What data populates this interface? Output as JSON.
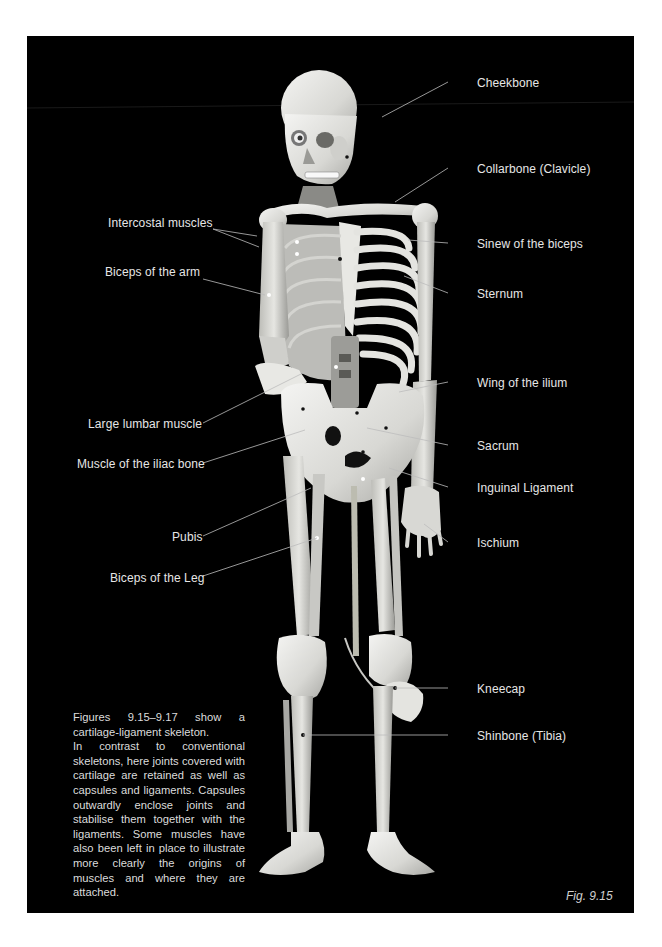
{
  "figure": {
    "number": "Fig. 9.15",
    "background": "#000000",
    "label_color": "#e6e6e6"
  },
  "labels": {
    "left": [
      {
        "id": "intercostal",
        "text": "Intercostal muscles",
        "x": 108,
        "y": 216
      },
      {
        "id": "biceps-arm",
        "text": "Biceps of the arm",
        "x": 105,
        "y": 265
      },
      {
        "id": "lumbar",
        "text": "Large lumbar muscle",
        "x": 88,
        "y": 417
      },
      {
        "id": "iliac",
        "text": "Muscle of the iliac bone",
        "x": 77,
        "y": 457
      },
      {
        "id": "pubis",
        "text": "Pubis",
        "x": 172,
        "y": 530
      },
      {
        "id": "biceps-leg",
        "text": "Biceps of the Leg",
        "x": 110,
        "y": 571
      }
    ],
    "right": [
      {
        "id": "cheekbone",
        "text": "Cheekbone",
        "x": 477,
        "y": 76
      },
      {
        "id": "collarbone",
        "text": "Collarbone (Clavicle)",
        "x": 477,
        "y": 162
      },
      {
        "id": "sinew-biceps",
        "text": "Sinew of the biceps",
        "x": 477,
        "y": 237
      },
      {
        "id": "sternum",
        "text": "Sternum",
        "x": 477,
        "y": 287
      },
      {
        "id": "wing-ilium",
        "text": "Wing of the ilium",
        "x": 477,
        "y": 376
      },
      {
        "id": "sacrum",
        "text": "Sacrum",
        "x": 477,
        "y": 439
      },
      {
        "id": "inguinal",
        "text": "Inguinal Ligament",
        "x": 477,
        "y": 481
      },
      {
        "id": "ischium",
        "text": "Ischium",
        "x": 477,
        "y": 536
      },
      {
        "id": "kneecap",
        "text": "Kneecap",
        "x": 477,
        "y": 682
      },
      {
        "id": "shinbone",
        "text": "Shinbone (Tibia)",
        "x": 477,
        "y": 729
      }
    ]
  },
  "caption": {
    "lines": [
      "Figures 9.15–9.17 show a cartilage-ligament skeleton.",
      "In contrast to conventional skeletons, here joints covered with cartilage are retained as well as capsules and ligaments. Capsules outwardly enclose joints and stabilise them together with the ligaments. Some muscles have also been left in place to illustrate more clearly the origins of muscles and where they are attached."
    ]
  }
}
